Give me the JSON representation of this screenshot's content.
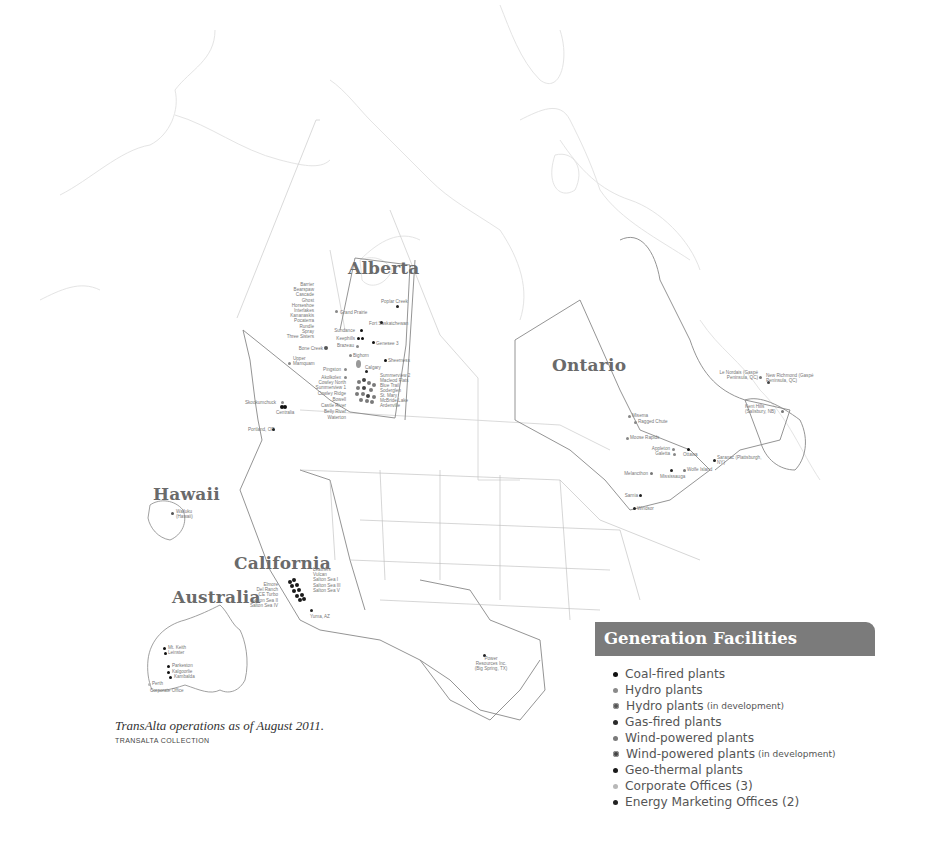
{
  "colors": {
    "coal": "#111111",
    "hydro": "#8a8a8a",
    "hydro_dev": "#555555",
    "gas": "#2a2a2a",
    "wind": "#7a7a7a",
    "wind_dev": "#444444",
    "geothermal": "#1a1a1a",
    "corporate": "#b8b8b8",
    "energy_marketing": "#222222",
    "legend_header_bg": "#7b7b7b",
    "region_title": "#6a6a6a"
  },
  "regions": {
    "alberta": "Alberta",
    "ontario": "Ontario",
    "hawaii": "Hawaii",
    "california": "California",
    "australia": "Australia"
  },
  "labels": {
    "bc_hydro_list": [
      "Barrier",
      "Bearspaw",
      "Cascade",
      "Ghost",
      "Horseshoe",
      "Interlakes",
      "Kananaskis",
      "Pocaterra",
      "Rundle",
      "Spray",
      "Three Sisters"
    ],
    "alberta": {
      "poplar_creek": "Poplar Creek",
      "grand_prairie": "Grand Prairie",
      "fort_sask": "Fort Saskatchewan",
      "sundance": "Sundance",
      "keephills": "Keephills",
      "genesee": "Genesee 3",
      "brazeau": "Brazeau",
      "bone_creek": "Bone Creek",
      "bighorn": "Bighorn",
      "upper_mamquam": "Upper Mamquam",
      "sheerness": "Sheerness",
      "calgary": "Calgary",
      "pingston": "Pingston",
      "taylor_dam": "Akolkolex",
      "summerview2": "Summerview 2",
      "macleod": "Macleod Flats",
      "blue_trail": "Blue Trail",
      "soderglen": "Soderglen",
      "st_mary": "St. Mary",
      "mcbride": "McBride Lake",
      "ardenville": "Ardenville",
      "cowley_north": "Cowley North",
      "summerview1": "Summerview 1",
      "cowley_ridge": "Cowley Ridge",
      "belly_river_left": "Bowell",
      "castle_river": "Castle River",
      "belly_river": "Belly River",
      "waterton": "Waterton"
    },
    "west": {
      "skookumchuck": "Skookumchuck",
      "centralia": "Centralia",
      "portland": "Portland, OR"
    },
    "hawaii_site": "Wailuku (Hawaii)",
    "california": {
      "left": [
        "Elmore",
        "Del Ranch",
        "CE Turbo",
        "Salton Sea II",
        "Salton Sea IV"
      ],
      "right": [
        "Leathers",
        "Vulcan",
        "Salton Sea I",
        "Salton Sea III",
        "Salton Sea V"
      ],
      "yuma": "Yuma, AZ"
    },
    "australia": {
      "mt_keith": "Mt. Keith",
      "leinster": "Leinster",
      "parkeston": "Parkeston",
      "kalgoorlie": "Kalgoorlie",
      "kambalda": "Kambalda",
      "perth": "Perth",
      "corporate": "Corporate Office"
    },
    "texas": "Power Resources Inc. (Big Spring, TX)",
    "east": {
      "le_nordais": "Le Nordais (Gaspé Peninsula, QC)",
      "new_richmond": "New Richmond (Gaspé Peninsula, QC)",
      "kent_hills": "Kent Hills (Salisbury, NB)",
      "misema": "Misema",
      "ragged_chute": "Ragged Chute",
      "moose_rapids": "Moose Rapids",
      "appleton": "Appleton",
      "galetta": "Galetta",
      "ottawa": "Ottawa",
      "saranac": "Saranac (Plattsburgh, NY)",
      "melancthon": "Melancthon",
      "mississauga": "Mississauga",
      "wolfe_island": "Wolfe Island",
      "sarnia": "Sarnia",
      "windsor": "Windsor"
    }
  },
  "legend": {
    "title": "Generation Facilities",
    "items": [
      {
        "label": "Coal-fired plants",
        "note": "",
        "type": "coal"
      },
      {
        "label": "Hydro plants",
        "note": "",
        "type": "hydro"
      },
      {
        "label": "Hydro plants",
        "note": "(in development)",
        "type": "hydro_dev"
      },
      {
        "label": "Gas-fired plants",
        "note": "",
        "type": "gas"
      },
      {
        "label": "Wind-powered plants",
        "note": "",
        "type": "wind"
      },
      {
        "label": "Wind-powered plants",
        "note": "(in development)",
        "type": "wind_dev"
      },
      {
        "label": "Geo-thermal plants",
        "note": "",
        "type": "geothermal"
      },
      {
        "label": "Corporate Offices (3)",
        "note": "",
        "type": "corporate"
      },
      {
        "label": "Energy Marketing Offices (2)",
        "note": "",
        "type": "energy_marketing"
      }
    ]
  },
  "caption": "TransAlta operations as of August 2011.",
  "credit": "TRANSALTA COLLECTION"
}
